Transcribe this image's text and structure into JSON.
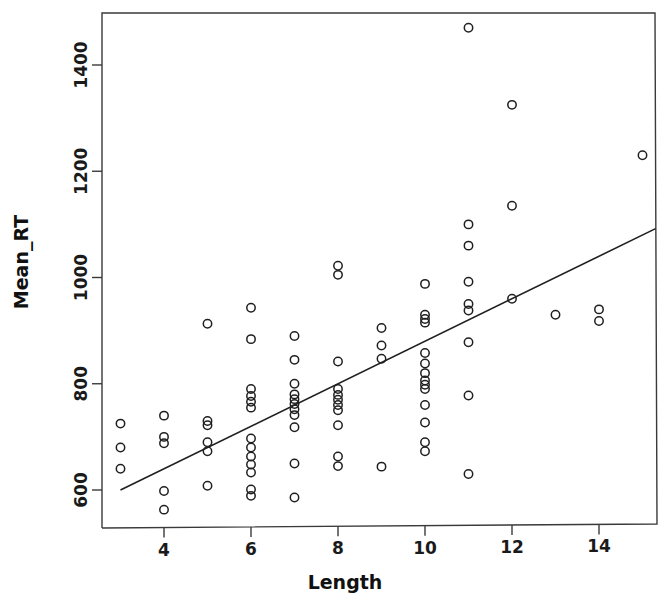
{
  "chart_data": {
    "type": "scatter",
    "title": "",
    "xlabel": "Length",
    "ylabel": "Mean_RT",
    "xlim": [
      2.55,
      15.7
    ],
    "ylim": [
      540,
      1510
    ],
    "grid": false,
    "legend": "none",
    "x_ticks": [
      4,
      6,
      8,
      10,
      12,
      14
    ],
    "x_tick_labels": [
      "4",
      "6",
      "8",
      "10",
      "12",
      "14"
    ],
    "y_ticks": [
      600,
      800,
      1000,
      1200,
      1400
    ],
    "y_tick_labels": [
      "600",
      "800",
      "1000",
      "1200",
      "1400"
    ],
    "marker": "open-circle",
    "marker_color": "#1f1f1f",
    "points": [
      {
        "x": 3,
        "y": 725
      },
      {
        "x": 3,
        "y": 680
      },
      {
        "x": 3,
        "y": 640
      },
      {
        "x": 4,
        "y": 740
      },
      {
        "x": 4,
        "y": 700
      },
      {
        "x": 4,
        "y": 688
      },
      {
        "x": 4,
        "y": 598
      },
      {
        "x": 4,
        "y": 563
      },
      {
        "x": 5,
        "y": 913
      },
      {
        "x": 5,
        "y": 730
      },
      {
        "x": 5,
        "y": 722
      },
      {
        "x": 5,
        "y": 690
      },
      {
        "x": 5,
        "y": 673
      },
      {
        "x": 5,
        "y": 608
      },
      {
        "x": 6,
        "y": 943
      },
      {
        "x": 6,
        "y": 884
      },
      {
        "x": 6,
        "y": 790
      },
      {
        "x": 6,
        "y": 777
      },
      {
        "x": 6,
        "y": 766
      },
      {
        "x": 6,
        "y": 755
      },
      {
        "x": 6,
        "y": 697
      },
      {
        "x": 6,
        "y": 680
      },
      {
        "x": 6,
        "y": 663
      },
      {
        "x": 6,
        "y": 648
      },
      {
        "x": 6,
        "y": 633
      },
      {
        "x": 6,
        "y": 601
      },
      {
        "x": 6,
        "y": 589
      },
      {
        "x": 7,
        "y": 890
      },
      {
        "x": 7,
        "y": 845
      },
      {
        "x": 7,
        "y": 800
      },
      {
        "x": 7,
        "y": 780
      },
      {
        "x": 7,
        "y": 771
      },
      {
        "x": 7,
        "y": 762
      },
      {
        "x": 7,
        "y": 752
      },
      {
        "x": 7,
        "y": 741
      },
      {
        "x": 7,
        "y": 718
      },
      {
        "x": 7,
        "y": 650
      },
      {
        "x": 7,
        "y": 586
      },
      {
        "x": 8,
        "y": 1022
      },
      {
        "x": 8,
        "y": 1005
      },
      {
        "x": 8,
        "y": 842
      },
      {
        "x": 8,
        "y": 790
      },
      {
        "x": 8,
        "y": 779
      },
      {
        "x": 8,
        "y": 770
      },
      {
        "x": 8,
        "y": 760
      },
      {
        "x": 8,
        "y": 750
      },
      {
        "x": 8,
        "y": 722
      },
      {
        "x": 8,
        "y": 663
      },
      {
        "x": 8,
        "y": 645
      },
      {
        "x": 9,
        "y": 905
      },
      {
        "x": 9,
        "y": 872
      },
      {
        "x": 9,
        "y": 847
      },
      {
        "x": 9,
        "y": 644
      },
      {
        "x": 10,
        "y": 988
      },
      {
        "x": 10,
        "y": 930
      },
      {
        "x": 10,
        "y": 922
      },
      {
        "x": 10,
        "y": 915
      },
      {
        "x": 10,
        "y": 858
      },
      {
        "x": 10,
        "y": 838
      },
      {
        "x": 10,
        "y": 820
      },
      {
        "x": 10,
        "y": 806
      },
      {
        "x": 10,
        "y": 798
      },
      {
        "x": 10,
        "y": 790
      },
      {
        "x": 10,
        "y": 760
      },
      {
        "x": 10,
        "y": 727
      },
      {
        "x": 10,
        "y": 690
      },
      {
        "x": 10,
        "y": 673
      },
      {
        "x": 11,
        "y": 1470
      },
      {
        "x": 11,
        "y": 1100
      },
      {
        "x": 11,
        "y": 1060
      },
      {
        "x": 11,
        "y": 992
      },
      {
        "x": 11,
        "y": 950
      },
      {
        "x": 11,
        "y": 938
      },
      {
        "x": 11,
        "y": 878
      },
      {
        "x": 11,
        "y": 778
      },
      {
        "x": 11,
        "y": 630
      },
      {
        "x": 12,
        "y": 1325
      },
      {
        "x": 12,
        "y": 1135
      },
      {
        "x": 12,
        "y": 960
      },
      {
        "x": 13,
        "y": 930
      },
      {
        "x": 14,
        "y": 940
      },
      {
        "x": 14,
        "y": 918
      },
      {
        "x": 15,
        "y": 1230
      }
    ],
    "fit_line": {
      "label": "linear-regression",
      "x_start": 3.0,
      "y_start": 600,
      "x_end": 15.3,
      "y_end": 1092,
      "slope": 40,
      "intercept": 480,
      "color": "#1f1f1f"
    }
  },
  "axes": {
    "x_title": "Length",
    "y_title": "Mean_RT"
  }
}
